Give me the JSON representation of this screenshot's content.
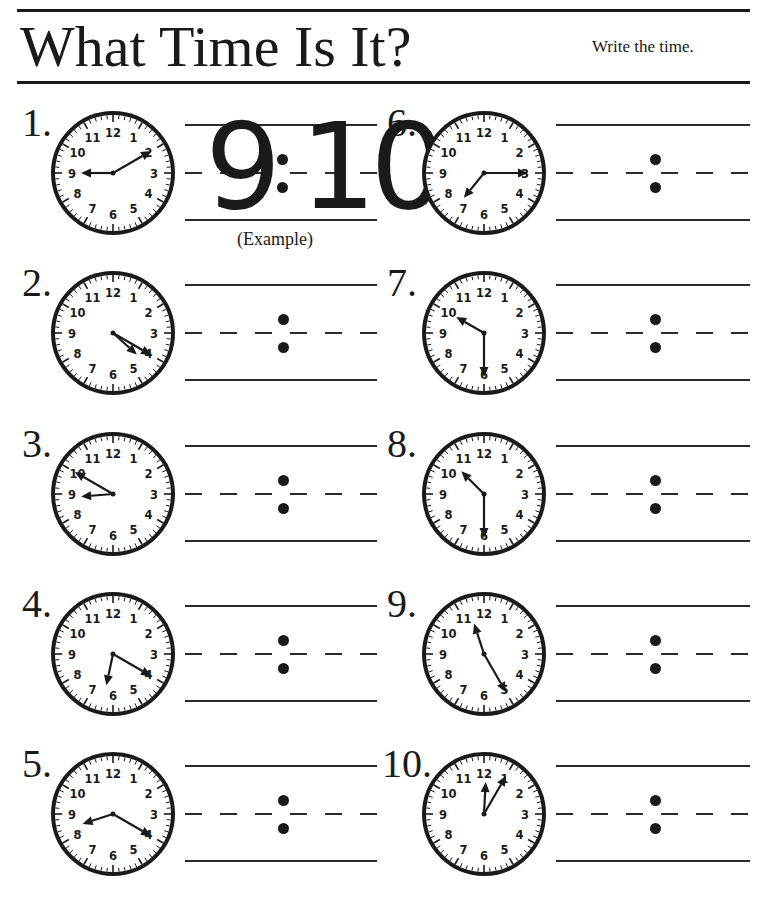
{
  "header": {
    "title": "What Time Is It?",
    "instruction": "Write the time."
  },
  "example": {
    "answer_hour": "9",
    "answer_colon": ":",
    "answer_minute": "10",
    "caption": "(Example)"
  },
  "clock_face_numbers": [
    "12",
    "1",
    "2",
    "3",
    "4",
    "5",
    "6",
    "7",
    "8",
    "9",
    "10",
    "11"
  ],
  "colors": {
    "ink": "#1a1a1a",
    "paper": "#ffffff"
  },
  "items": [
    {
      "label": "1.",
      "hour_hand_pos": 9.0,
      "minute_hand_pos": 2,
      "time_shown": "9:10",
      "is_example": true
    },
    {
      "label": "2.",
      "hour_hand_pos": 4.4,
      "minute_hand_pos": 4,
      "time_shown": "4:20",
      "is_example": false
    },
    {
      "label": "3.",
      "hour_hand_pos": 8.85,
      "minute_hand_pos": 10,
      "time_shown": "8:50",
      "is_example": false
    },
    {
      "label": "4.",
      "hour_hand_pos": 6.4,
      "minute_hand_pos": 4,
      "time_shown": "6:20",
      "is_example": false
    },
    {
      "label": "5.",
      "hour_hand_pos": 8.4,
      "minute_hand_pos": 4,
      "time_shown": "8:20",
      "is_example": false
    },
    {
      "label": "6.",
      "hour_hand_pos": 7.3,
      "minute_hand_pos": 3,
      "time_shown": "7:15",
      "is_example": false
    },
    {
      "label": "7.",
      "hour_hand_pos": 10.0,
      "minute_hand_pos": 6,
      "time_shown": "10:30",
      "is_example": false
    },
    {
      "label": "8.",
      "hour_hand_pos": 10.5,
      "minute_hand_pos": 6,
      "time_shown": "10:30",
      "is_example": false
    },
    {
      "label": "9.",
      "hour_hand_pos": 11.4,
      "minute_hand_pos": 5,
      "time_shown": "11:25",
      "is_example": false
    },
    {
      "label": "10.",
      "hour_hand_pos": 12.1,
      "minute_hand_pos": 1,
      "time_shown": "12:05",
      "is_example": false
    }
  ]
}
